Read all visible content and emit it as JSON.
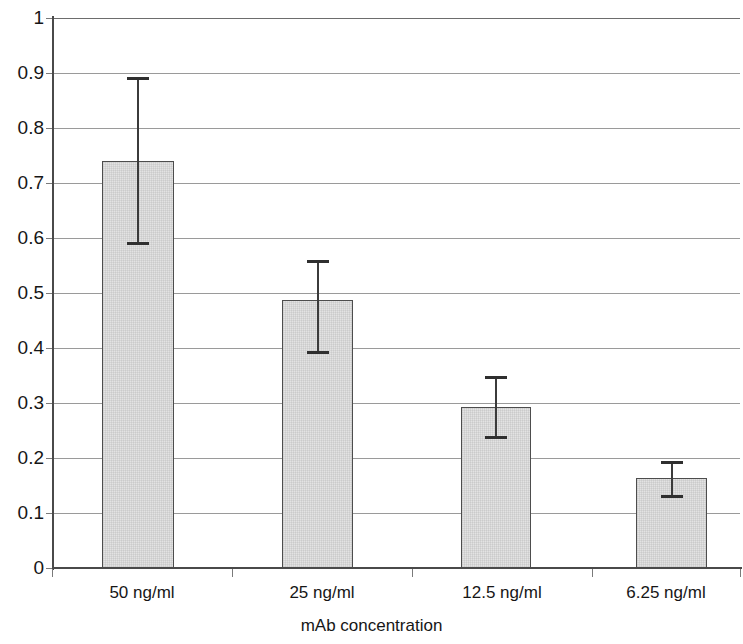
{
  "chart_data": {
    "type": "bar",
    "title": "",
    "xlabel": "mAb concentration",
    "ylabel": "",
    "categories": [
      "50 ng/ml",
      "25 ng/ml",
      "12.5 ng/ml",
      "6.25 ng/ml"
    ],
    "values": [
      0.74,
      0.488,
      0.293,
      0.163
    ],
    "errors_upper": [
      0.152,
      0.072,
      0.057,
      0.031
    ],
    "errors_lower": [
      0.152,
      0.099,
      0.059,
      0.035
    ],
    "error_top_values": [
      0.892,
      0.56,
      0.35,
      0.194
    ],
    "error_bottom_values": [
      0.588,
      0.389,
      0.234,
      0.128
    ],
    "ylim": [
      0,
      1
    ],
    "ytick_labels": [
      "0",
      "0.1",
      "0.2",
      "0.3",
      "0.4",
      "0.5",
      "0.6",
      "0.7",
      "0.8",
      "0.9",
      "1"
    ],
    "ytick_values": [
      0,
      0.1,
      0.2,
      0.3,
      0.4,
      0.5,
      0.6,
      0.7,
      0.8,
      0.9,
      1
    ],
    "grid": true,
    "legend": false,
    "bar_fill_color": "#e3e3e3",
    "bar_border_color": "#4d4d4d",
    "gridline_color": "#9a9a9a",
    "axis_color": "#4a4a4a",
    "error_bar_color": "#2f2f2f"
  },
  "geometry": {
    "plot_left": 52,
    "plot_right": 740,
    "y_zero_px": 568,
    "y_one_px": 18,
    "bar_left_px": [
      102,
      282,
      461,
      636
    ],
    "bar_width_px": [
      72,
      71,
      70,
      71
    ],
    "cat_tick_px": [
      52,
      232,
      412,
      592,
      740
    ]
  }
}
